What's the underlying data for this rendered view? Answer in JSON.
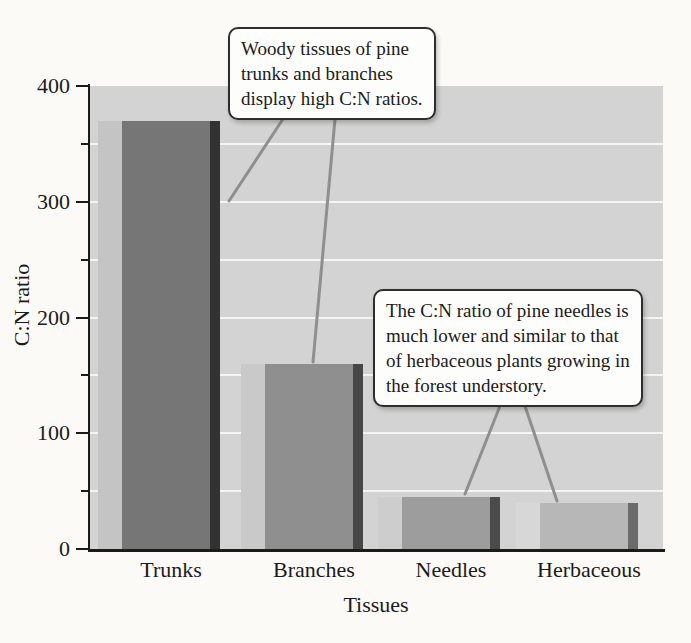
{
  "chart_data": {
    "type": "bar",
    "title": "",
    "categories": [
      "Trunks",
      "Branches",
      "Needles",
      "Herbaceous"
    ],
    "values": [
      370,
      160,
      45,
      40
    ],
    "xlabel": "Tissues",
    "ylabel": "C:N ratio",
    "ylim": [
      0,
      400
    ],
    "yticks_major": [
      400,
      300,
      200,
      100,
      0
    ],
    "yticks_minor": [
      350,
      250,
      150,
      50
    ],
    "gridlines": [
      350,
      300,
      250,
      200,
      150,
      100,
      50
    ],
    "grid": true,
    "legend": "none",
    "plot_bg_color": "#d3d3d3",
    "gridline_color": "#f4f4f1",
    "axis_color": "#1b1b1b",
    "connector_color": "#8f8f8f",
    "bar_colors": [
      {
        "highlight": "#c4c4c4",
        "face": "#767676",
        "shadow": "#323232"
      },
      {
        "highlight": "#c9c9c9",
        "face": "#8f8f8f",
        "shadow": "#474747"
      },
      {
        "highlight": "#cdcdcd",
        "face": "#9d9d9d",
        "shadow": "#4b4b4b"
      },
      {
        "highlight": "#d7d7d7",
        "face": "#b7b7b7",
        "shadow": "#6b6b6b"
      }
    ],
    "annotations": [
      {
        "text": "Woody tissues of pine trunks and branches display high C:N ratios.",
        "lines": [
          "Woody tissues of pine",
          "trunks and branches",
          "display high C:N ratios."
        ],
        "targets": [
          "Trunks",
          "Branches"
        ]
      },
      {
        "text": "The C:N ratio of pine needles is much lower and similar to that of herbaceous plants growing in the forest understory.",
        "lines": [
          "The C:N ratio of pine needles is",
          "much lower and similar to that",
          "of herbaceous plants growing in",
          "the forest understory."
        ],
        "targets": [
          "Needles",
          "Herbaceous"
        ]
      }
    ]
  }
}
